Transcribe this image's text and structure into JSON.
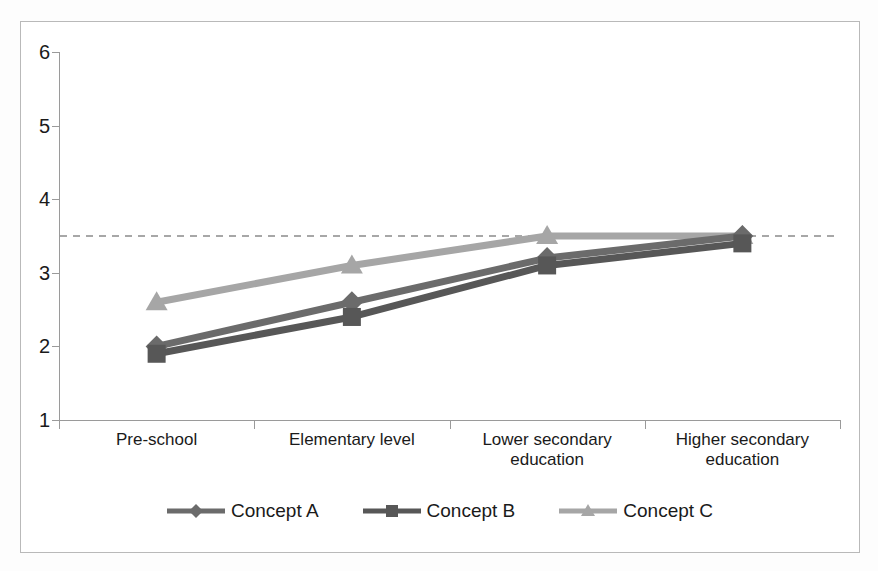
{
  "chart_data": {
    "type": "line",
    "title": "",
    "subtitle": "",
    "xlabel": "",
    "ylabel": "",
    "categories": [
      "Pre-school",
      "Elementary level",
      "Lower secondary\neducation",
      "Higher secondary\neducation"
    ],
    "category_labels_flat": [
      "Pre-school",
      "Elementary level",
      "Lower secondary education",
      "Higher secondary education"
    ],
    "series": [
      {
        "name": "Concept A",
        "marker": "diamond",
        "color": "#6b6b6b",
        "values": [
          2.0,
          2.6,
          3.2,
          3.5
        ]
      },
      {
        "name": "Concept B",
        "marker": "square",
        "color": "#575757",
        "values": [
          1.9,
          2.4,
          3.1,
          3.4
        ]
      },
      {
        "name": "Concept C",
        "marker": "triangle",
        "color": "#a6a6a6",
        "values": [
          2.6,
          3.1,
          3.5,
          3.5
        ]
      }
    ],
    "reference_line": {
      "value": 3.5,
      "style": "dashed",
      "color": "#8a8a8a"
    },
    "ylim": [
      1,
      6
    ],
    "yticks": [
      1,
      2,
      3,
      4,
      5,
      6
    ],
    "ytick_labels": [
      "1",
      "2",
      "3",
      "4",
      "5",
      "6"
    ],
    "grid": false,
    "legend_position": "bottom",
    "background": "#ffffff",
    "axis_color": "#9a9a9a",
    "text_color": "#1a1a1a"
  },
  "legend": {
    "items": [
      {
        "label": "Concept A"
      },
      {
        "label": "Concept B"
      },
      {
        "label": "Concept C"
      }
    ]
  },
  "axes": {
    "y": {
      "labels": [
        "6",
        "5",
        "4",
        "3",
        "2",
        "1"
      ]
    },
    "x": {
      "labels": [
        "Pre-school",
        "Elementary level",
        "Lower secondary\neducation",
        "Higher secondary\neducation"
      ]
    }
  }
}
